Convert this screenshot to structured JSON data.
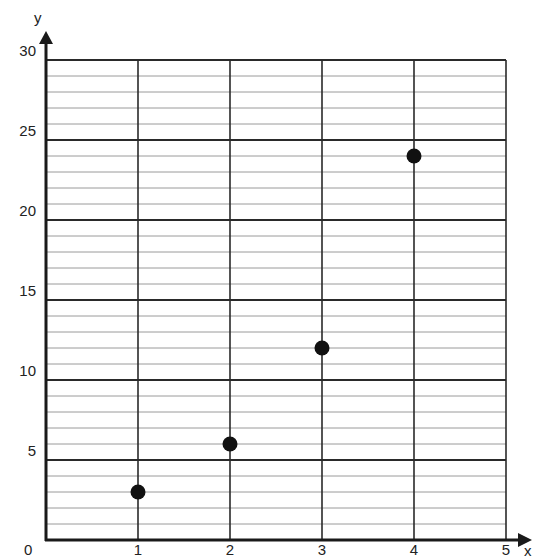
{
  "chart_data": {
    "type": "scatter",
    "title": "",
    "xlabel": "x",
    "ylabel": "y",
    "xlim": [
      0,
      5
    ],
    "ylim": [
      0,
      30
    ],
    "x_ticks": [
      "1",
      "2",
      "3",
      "4",
      "5"
    ],
    "y_ticks": [
      "5",
      "10",
      "15",
      "20",
      "25",
      "30"
    ],
    "origin_label": "0",
    "grid": true,
    "minor_grid_step_y": 1,
    "major_grid_step_y": 5,
    "grid_step_x": 1,
    "series": [
      {
        "name": "points",
        "x": [
          1,
          2,
          3,
          4
        ],
        "y": [
          3,
          6,
          12,
          24
        ]
      }
    ],
    "colors": {
      "axis": "#1a1a1a",
      "major_grid": "#2a2a2a",
      "minor_grid": "#9a9a9a",
      "point": "#111111"
    }
  }
}
